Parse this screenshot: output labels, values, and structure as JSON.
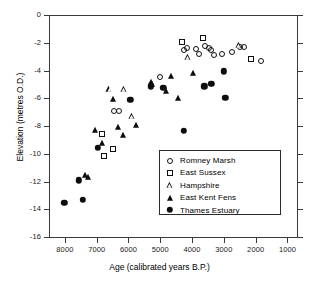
{
  "chart_data": {
    "type": "scatter",
    "title": "",
    "xlabel": "Age (calibrated years B.P.)",
    "ylabel": "Elevation (metres O.D.)",
    "xlim": [
      8500,
      700
    ],
    "ylim": [
      -16,
      0
    ],
    "x_reversed": true,
    "grid": false,
    "legend_position": "inside-lower-right",
    "xticks": [
      8000,
      7000,
      6000,
      5000,
      4000,
      3000,
      2000,
      1000
    ],
    "xtick_labels": [
      "8000",
      "7000",
      "6000",
      "5000",
      "4000",
      "3000",
      "2000",
      "1000"
    ],
    "yticks": [
      0,
      -2,
      -4,
      -6,
      -8,
      -10,
      -12,
      -14,
      -16
    ],
    "ytick_labels": [
      "0",
      "-2",
      "-4",
      "-6",
      "-8",
      "-10",
      "-12",
      "-14",
      "-16"
    ],
    "series": [
      {
        "name": "Romney Marsh",
        "marker": "open-circle",
        "color": "#111111",
        "points": [
          [
            6460,
            -6.9
          ],
          [
            6300,
            -6.95
          ],
          [
            5000,
            -4.5
          ],
          [
            4250,
            -2.55
          ],
          [
            4150,
            -2.35
          ],
          [
            3880,
            -2.45
          ],
          [
            3780,
            -2.8
          ],
          [
            3600,
            -2.25
          ],
          [
            3480,
            -2.4
          ],
          [
            3400,
            -2.55
          ],
          [
            3300,
            -2.85
          ],
          [
            3060,
            -2.8
          ],
          [
            2760,
            -2.7
          ],
          [
            2480,
            -2.3
          ],
          [
            2380,
            -2.3
          ],
          [
            1840,
            -3.35
          ]
        ]
      },
      {
        "name": "East Sussex",
        "marker": "open-square",
        "color": "#111111",
        "points": [
          [
            6840,
            -8.55
          ],
          [
            6760,
            -10.15
          ],
          [
            6480,
            -9.65
          ],
          [
            4310,
            -1.95
          ],
          [
            3660,
            -1.65
          ],
          [
            2160,
            -3.2
          ]
        ]
      },
      {
        "name": "Hampshire",
        "marker": "open-triangle",
        "color": "#111111",
        "points": [
          [
            6600,
            -5.35
          ],
          [
            6150,
            -5.3
          ],
          [
            5900,
            -7.3
          ],
          [
            4120,
            -3.05
          ],
          [
            2520,
            -2.15
          ]
        ]
      },
      {
        "name": "East Kent Fens",
        "marker": "filled-triangle",
        "color": "#0d0d0d",
        "points": [
          [
            7380,
            -11.55
          ],
          [
            7280,
            -11.65
          ],
          [
            7040,
            -8.3
          ],
          [
            6820,
            -9.2
          ],
          [
            6480,
            -6.05
          ],
          [
            6340,
            -8.05
          ],
          [
            6180,
            -8.65
          ],
          [
            5760,
            -7.9
          ],
          [
            5300,
            -4.85
          ],
          [
            5260,
            -5.0
          ],
          [
            4820,
            -5.5
          ],
          [
            4660,
            -4.4
          ],
          [
            4440,
            -5.95
          ],
          [
            3980,
            -4.2
          ]
        ]
      },
      {
        "name": "Thames Estuary",
        "marker": "filled-circle",
        "color": "#0d0d0d",
        "points": [
          [
            8020,
            -13.55
          ],
          [
            7560,
            -11.9
          ],
          [
            7440,
            -13.3
          ],
          [
            6960,
            -9.55
          ],
          [
            5940,
            -6.1
          ],
          [
            5300,
            -5.15
          ],
          [
            4900,
            -5.25
          ],
          [
            4260,
            -8.35
          ],
          [
            3620,
            -5.15
          ],
          [
            3400,
            -4.95
          ],
          [
            3010,
            -4.05
          ],
          [
            2960,
            -5.95
          ]
        ]
      }
    ]
  },
  "legend": {
    "entries": [
      {
        "label": "Romney Marsh",
        "marker": "open-circle"
      },
      {
        "label": "East Sussex",
        "marker": "open-square"
      },
      {
        "label": "Hampshire",
        "marker": "open-triangle"
      },
      {
        "label": "East Kent Fens",
        "marker": "filled-triangle"
      },
      {
        "label": "Thames Estuary",
        "marker": "filled-circle"
      }
    ]
  },
  "style": {
    "axis_color": "#3a3a3a",
    "marker_color": "#111111",
    "background": "#ffffff"
  }
}
